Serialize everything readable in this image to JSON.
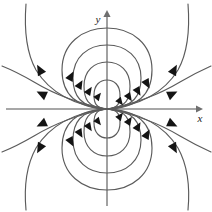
{
  "figure": {
    "background_color": "#ffffff",
    "width": 212,
    "height": 212
  },
  "axes": {
    "origin": {
      "x": 107,
      "y": 109
    },
    "x_axis": {
      "label": "x",
      "label_position": {
        "x": 200,
        "y": 121
      },
      "start": {
        "x": 6,
        "y": 109
      },
      "end": {
        "x": 198,
        "y": 109
      },
      "color": "#8a8a8a",
      "has_arrow": true
    },
    "y_axis": {
      "label": "y",
      "label_position": {
        "x": 99,
        "y": 22
      },
      "start": {
        "x": 107,
        "y": 206
      },
      "end": {
        "x": 107,
        "y": 14
      },
      "color": "#8a8a8a",
      "has_arrow": true
    }
  },
  "field": {
    "type": "dipole",
    "line_color": "#5b5b5b",
    "arrow_color": "#141414",
    "line_width": 1.15,
    "upper_loop_y_crossings": [
      28,
      45,
      62,
      80
    ],
    "lower_loop_y_crossings": [
      190,
      173,
      156,
      138
    ],
    "upper_loop_half_widths": [
      45,
      34,
      23,
      13
    ],
    "lower_loop_half_widths": [
      45,
      34,
      23,
      13
    ],
    "loop_count_per_side": 4,
    "outer_curve_count": 8,
    "flow_direction": "into-origin-on-right, out-of-origin-on-left"
  },
  "legend": {
    "visible": false
  }
}
